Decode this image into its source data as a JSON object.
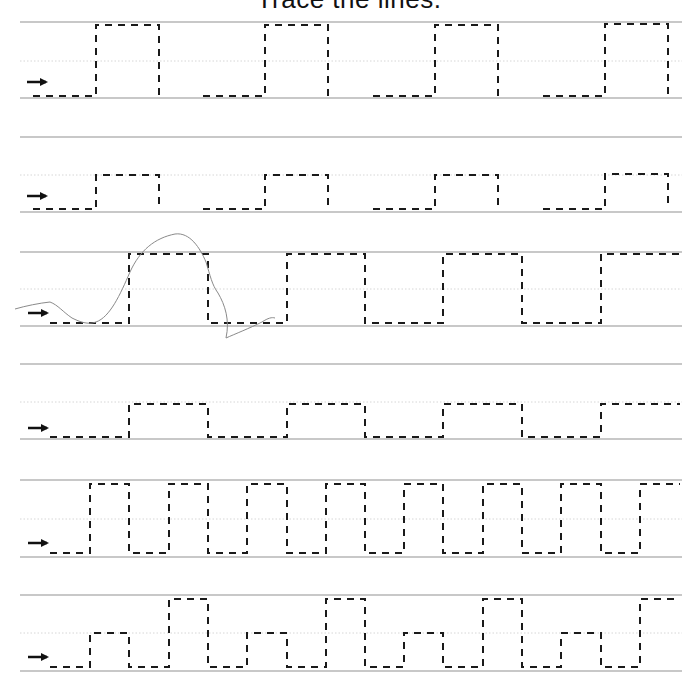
{
  "worksheet": {
    "title": "Trace the lines.",
    "colors": {
      "guide_line": "#c8c8c8",
      "mid_line": "#d6d6d6",
      "trace": "#1a1a1a",
      "arrow": "#111111",
      "scribble": "#8a8a8a"
    },
    "rows": [
      {
        "name": "row-1-tall-square-gaps",
        "top": 22,
        "mid": 61,
        "bottom": 98,
        "arrow": {
          "x1": 27,
          "x2": 52,
          "y": 82
        },
        "paths": [
          "M33,96 L96,96 L96,25 L159,25 L159,96",
          "M203,96 L265,96 L265,25 L328,25 L328,96",
          "M373,96 L435,96 L435,25 L498,25 L498,96",
          "M543,96 L605,96 L605,24 L668,24 L668,96"
        ]
      },
      {
        "name": "row-2-short-square-gaps",
        "top": 137,
        "mid": 175,
        "bottom": 212,
        "arrow": {
          "x1": 27,
          "x2": 52,
          "y": 196
        },
        "paths": [
          "M33,209 L96,209 L96,175 L159,175 L159,209",
          "M203,209 L265,209 L265,175 L328,175 L328,209",
          "M373,209 L435,209 L435,175 L498,175 L498,209",
          "M543,209 L605,209 L605,174 L668,174 L668,209"
        ]
      },
      {
        "name": "row-3-tall-square-wave",
        "top": 252,
        "mid": 289,
        "bottom": 326,
        "arrow": {
          "x1": 28,
          "x2": 53,
          "y": 313
        },
        "paths": [
          "M50,323 L129,323 L129,254 L208,254 L208,323 L287,323 L287,254 L365,254 L365,323 L443,323 L443,254 L522,254 L522,323 L601,323 L601,254 L680,254"
        ],
        "scribble": "M15,309 C25,306 40,303 50,302 C58,305 63,312 72,318 C80,322 88,325 96,322 C110,317 120,295 130,272 C140,250 155,238 175,234 C190,232 200,248 206,262 C210,275 212,285 218,293 C225,305 230,320 226,338 C235,334 250,328 262,322 C268,318 272,317 275,318"
      },
      {
        "name": "row-4-short-square-wave",
        "top": 364,
        "mid": 402,
        "bottom": 439,
        "arrow": {
          "x1": 28,
          "x2": 53,
          "y": 428
        },
        "paths": [
          "M50,437 L129,437 L129,404 L208,404 L208,437 L287,437 L287,404 L365,404 L365,437 L443,437 L443,404 L522,404 L522,437 L601,437 L601,404 L680,404"
        ]
      },
      {
        "name": "row-5-narrow-tall-wave",
        "top": 480,
        "mid": 519,
        "bottom": 557,
        "arrow": {
          "x1": 28,
          "x2": 53,
          "y": 543
        },
        "paths": [
          "M50,553 L90,553 L90,484 L129,484 L129,553 L169,553 L169,484 L208,484 L208,553 L247,553 L247,484 L287,484 L287,553 L326,553 L326,484 L365,484 L365,553 L404,553 L404,484 L443,484 L443,553 L483,553 L483,484 L522,484 L522,553 L561,553 L561,484 L601,484 L601,553 L640,553 L640,484 L680,484"
        ]
      },
      {
        "name": "row-6-alternating-height-wave",
        "top": 595,
        "mid": 633,
        "bottom": 671,
        "arrow": {
          "x1": 28,
          "x2": 53,
          "y": 657
        },
        "paths": [
          "M50,667 L90,667 L90,633 L129,633 L129,667 L169,667 L169,599 L208,599 L208,667 L247,667 L247,633 L287,633 L287,667 L326,667 L326,599 L365,599 L365,667 L404,667 L404,633 L443,633 L443,667 L483,667 L483,599 L522,599 L522,667 L561,667 L561,633 L601,633 L601,667 L640,667 L640,599 L680,599"
        ]
      }
    ],
    "line_left": 20,
    "line_right": 682
  }
}
